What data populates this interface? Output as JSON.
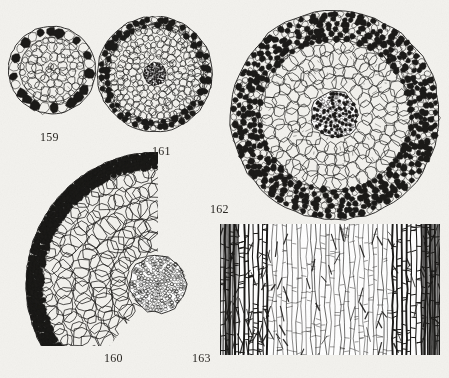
{
  "plate": {
    "width": 449,
    "height": 378,
    "background_color": "#f3f2ee",
    "ink_color": "#1b1a18",
    "label_color": "#2a2723",
    "caption_font_size": 12,
    "description": "Scanned botanical plate showing five micrograph figures of plant root and stem anatomy"
  },
  "figures": [
    {
      "id": "fig-159",
      "label": "159",
      "label_x": 40,
      "label_y": 131,
      "type": "cross-section-circular",
      "title": "Root cross-section with thick dark sclerenchyma ring",
      "bounds": {
        "x": 8,
        "y": 16,
        "width": 90,
        "height": 108
      },
      "center": {
        "cx": 52,
        "cy": 70
      },
      "outer_radius": 43,
      "ring_thickness": 11,
      "ring_cell_count": 34,
      "ring_cell_radius": 4.6,
      "inner_cell_rings": [
        {
          "radius": 30,
          "count": 26,
          "cell_radius": 3.6,
          "filled": false
        },
        {
          "radius": 22,
          "count": 18,
          "cell_radius": 4.6,
          "filled": false
        },
        {
          "radius": 13,
          "count": 12,
          "cell_radius": 4.6,
          "filled": false
        },
        {
          "radius": 5,
          "count": 6,
          "cell_radius": 3.4,
          "filled": false
        }
      ],
      "has_dark_core": false
    },
    {
      "id": "fig-161",
      "label": "161",
      "label_x": 152,
      "label_y": 145,
      "type": "cross-section-circular",
      "title": "Root cross-section with small dark central stele and fine cortex",
      "bounds": {
        "x": 96,
        "y": 16,
        "width": 118,
        "height": 118
      },
      "center": {
        "cx": 155,
        "cy": 74
      },
      "outer_radius": 57,
      "ring_thickness": 8,
      "ring_cell_count": 60,
      "ring_cell_radius": 3.1,
      "inner_cell_rings": [
        {
          "radius": 50,
          "count": 54,
          "cell_radius": 3.1,
          "filled": false
        },
        {
          "radius": 43,
          "count": 46,
          "cell_radius": 3.4,
          "filled": false
        },
        {
          "radius": 36,
          "count": 38,
          "cell_radius": 3.6,
          "filled": false
        },
        {
          "radius": 29,
          "count": 30,
          "cell_radius": 3.6,
          "filled": false
        },
        {
          "radius": 22,
          "count": 22,
          "cell_radius": 3.4,
          "filled": false
        },
        {
          "radius": 16,
          "count": 16,
          "cell_radius": 3.0,
          "filled": false
        }
      ],
      "has_dark_core": true,
      "core_radius": 11
    },
    {
      "id": "fig-162",
      "label": "162",
      "label_x": 210,
      "label_y": 203,
      "type": "cross-section-circular",
      "title": "Large root cross-section, dense dark cortex band and open parenchyma",
      "bounds": {
        "x": 228,
        "y": 10,
        "width": 214,
        "height": 212
      },
      "center": {
        "cx": 335,
        "cy": 115
      },
      "outer_radius": 104,
      "ring_thickness": 28,
      "ring_cell_count": 96,
      "ring_cell_radius": 3.0,
      "inner_cell_rings": [
        {
          "radius": 68,
          "count": 40,
          "cell_radius": 7.2,
          "filled": false
        },
        {
          "radius": 56,
          "count": 32,
          "cell_radius": 7.4,
          "filled": false
        },
        {
          "radius": 44,
          "count": 26,
          "cell_radius": 7.0,
          "filled": false
        },
        {
          "radius": 33,
          "count": 20,
          "cell_radius": 6.4,
          "filled": false
        }
      ],
      "has_dark_core": true,
      "core_radius": 23
    },
    {
      "id": "fig-160",
      "label": "160",
      "label_x": 104,
      "label_y": 352,
      "type": "cross-section-sector",
      "title": "Sector of root cross-section, large polygonal cortex cells and dark stele",
      "bounds": {
        "x": 14,
        "y": 152,
        "width": 186,
        "height": 194
      },
      "center": {
        "cx": 158,
        "cy": 284
      },
      "outer_radius": 132,
      "ring_thickness": 14,
      "ring_cell_count": 54,
      "ring_cell_radius": 3.6,
      "sector_start_deg": 128,
      "sector_end_deg": 270,
      "has_dark_core": true,
      "core_radius": 28
    },
    {
      "id": "fig-163",
      "label": "163",
      "label_x": 192,
      "label_y": 352,
      "type": "longitudinal-section",
      "title": "Longitudinal section showing elongated vertical cells with cross walls",
      "bounds": {
        "x": 220,
        "y": 224,
        "width": 220,
        "height": 131
      },
      "column_count": 46,
      "dark_band_columns": [
        0,
        13,
        30,
        46
      ],
      "cross_wall_density": 7
    }
  ]
}
